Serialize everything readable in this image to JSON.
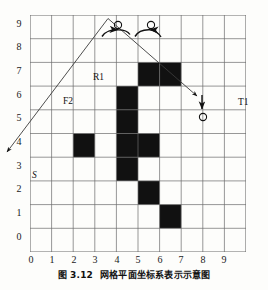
{
  "figure": {
    "caption_number": "图 3.12",
    "caption_text": "网格平面坐标系表示示意图"
  },
  "axes": {
    "x_ticks": [
      "0",
      "1",
      "2",
      "3",
      "4",
      "5",
      "6",
      "7",
      "8",
      "9"
    ],
    "y_ticks": [
      "0",
      "1",
      "2",
      "3",
      "4",
      "5",
      "6",
      "7",
      "8",
      "9"
    ],
    "grid_color": "#6b6b6b",
    "cell_fill_color": "#111111",
    "background_color": "#fdfdfb"
  },
  "annotations": [
    {
      "id": "label-s",
      "text": "S",
      "x": 32,
      "y": 174
    },
    {
      "id": "label-f2",
      "text": "F2",
      "x": 66,
      "y": 100
    },
    {
      "id": "label-r1",
      "text": "R1",
      "x": 94,
      "y": 76
    },
    {
      "id": "label-t1",
      "text": "T1",
      "x": 240,
      "y": 99
    }
  ],
  "markers": {
    "obstacle_circles": [
      {
        "id": "circle-top-left",
        "cx": 148,
        "cy": 44
      },
      {
        "id": "circle-top-right",
        "cx": 180,
        "cy": 44
      },
      {
        "id": "circle-right",
        "cx": 243,
        "cy": 127
      }
    ]
  },
  "chart_data": {
    "type": "heatmap",
    "title": "网格平面坐标系表示示意图",
    "xlabel": "",
    "ylabel": "",
    "xlim": [
      0,
      10
    ],
    "ylim": [
      0,
      10
    ],
    "grid": true,
    "legend": "none",
    "categories": [
      "0",
      "1",
      "2",
      "3",
      "4",
      "5",
      "6",
      "7",
      "8",
      "9"
    ],
    "filled_cells": [
      {
        "x": 2,
        "y": 4
      },
      {
        "x": 4,
        "y": 3
      },
      {
        "x": 4,
        "y": 4
      },
      {
        "x": 4,
        "y": 5
      },
      {
        "x": 4,
        "y": 6
      },
      {
        "x": 5,
        "y": 2
      },
      {
        "x": 5,
        "y": 4
      },
      {
        "x": 5,
        "y": 7
      },
      {
        "x": 6,
        "y": 7
      },
      {
        "x": 6,
        "y": 1
      }
    ],
    "paths": [
      {
        "name": "S-to-peak",
        "points": [
          [
            0.15,
            3.2
          ],
          [
            5.0,
            8.0
          ]
        ]
      },
      {
        "name": "peak-to-T1",
        "points": [
          [
            5.0,
            8.0
          ],
          [
            9.1,
            4.4
          ]
        ]
      }
    ],
    "annotations": [
      "S",
      "F2",
      "R1",
      "T1"
    ]
  }
}
